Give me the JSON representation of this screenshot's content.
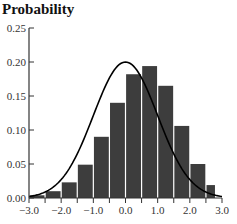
{
  "chart_data": {
    "type": "bar",
    "title": "Probability",
    "xlabel": "",
    "ylabel": "Probability",
    "xlim": [
      -3.0,
      3.0
    ],
    "ylim": [
      0.0,
      0.25
    ],
    "grid": false,
    "legend": null,
    "x_ticks": [
      -3.0,
      -2.0,
      -1.0,
      0.0,
      1.0,
      2.0,
      3.0
    ],
    "x_tick_labels": [
      "−3.0",
      "−2.0",
      "−1.0",
      "0.0",
      "1.0",
      "2.0",
      "3.0"
    ],
    "x_minor_ticks_step": 0.5,
    "y_ticks": [
      0.0,
      0.05,
      0.1,
      0.15,
      0.2,
      0.25
    ],
    "y_tick_labels": [
      "0.00",
      "0.05",
      "0.10",
      "0.15",
      "0.20",
      "0.25"
    ],
    "bins": [
      {
        "from": -3.0,
        "to": -2.5,
        "value": 0.004
      },
      {
        "from": -2.5,
        "to": -2.0,
        "value": 0.01
      },
      {
        "from": -2.0,
        "to": -1.5,
        "value": 0.023
      },
      {
        "from": -1.5,
        "to": -1.0,
        "value": 0.049
      },
      {
        "from": -1.0,
        "to": -0.5,
        "value": 0.09
      },
      {
        "from": -0.5,
        "to": 0.0,
        "value": 0.14
      },
      {
        "from": 0.0,
        "to": 0.5,
        "value": 0.182
      },
      {
        "from": 0.5,
        "to": 1.0,
        "value": 0.194
      },
      {
        "from": 1.0,
        "to": 1.5,
        "value": 0.165
      },
      {
        "from": 1.5,
        "to": 2.0,
        "value": 0.106
      },
      {
        "from": 2.0,
        "to": 2.5,
        "value": 0.05
      },
      {
        "from": 2.5,
        "to": 2.8,
        "value": 0.019
      }
    ],
    "series": [
      {
        "name": "histogram",
        "type": "bar",
        "color": "#3d3d3d"
      },
      {
        "name": "normal curve",
        "type": "line",
        "color": "#000000",
        "mean": 0.0,
        "sd": 1.0,
        "peak": 0.2
      }
    ]
  },
  "colors": {
    "bar": "#3d3d3d",
    "bar_gap": "#ffffff",
    "curve": "#000000",
    "axis": "#333333"
  }
}
